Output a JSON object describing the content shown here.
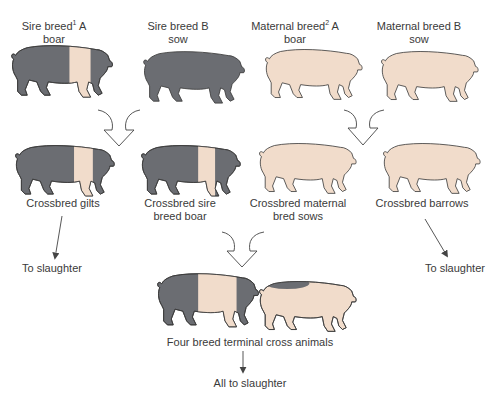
{
  "colors": {
    "dark_pig": "#6b6d72",
    "light_pig": "#f1dccb",
    "outline": "#3b3b3b",
    "arrow": "#444444"
  },
  "parents": [
    {
      "line1": "Sire breed",
      "sup": "1",
      "line1_suffix": " A",
      "line2": "boar",
      "type": "belted"
    },
    {
      "line1": "Sire breed B",
      "sup": "",
      "line1_suffix": "",
      "line2": "sow",
      "type": "dark"
    },
    {
      "line1": "Maternal breed",
      "sup": "2",
      "line1_suffix": " A",
      "line2": "boar",
      "type": "light"
    },
    {
      "line1": "Maternal breed B",
      "sup": "",
      "line1_suffix": "",
      "line2": "sow",
      "type": "light"
    }
  ],
  "crossbreds": [
    {
      "line1": "Crossbred gilts",
      "line2": "",
      "type": "belted"
    },
    {
      "line1": "Crossbred sire",
      "line2": "breed boar",
      "type": "belted"
    },
    {
      "line1": "Crossbred maternal",
      "line2": "bred sows",
      "type": "light"
    },
    {
      "line1": "Crossbred barrows",
      "line2": "",
      "type": "light"
    }
  ],
  "terminal": {
    "label": "Four breed terminal cross animals",
    "animals": [
      "belted-large",
      "light-spotted"
    ]
  },
  "outcomes": {
    "gilts": "To slaughter",
    "barrows": "To slaughter",
    "terminal": "All to slaughter"
  }
}
